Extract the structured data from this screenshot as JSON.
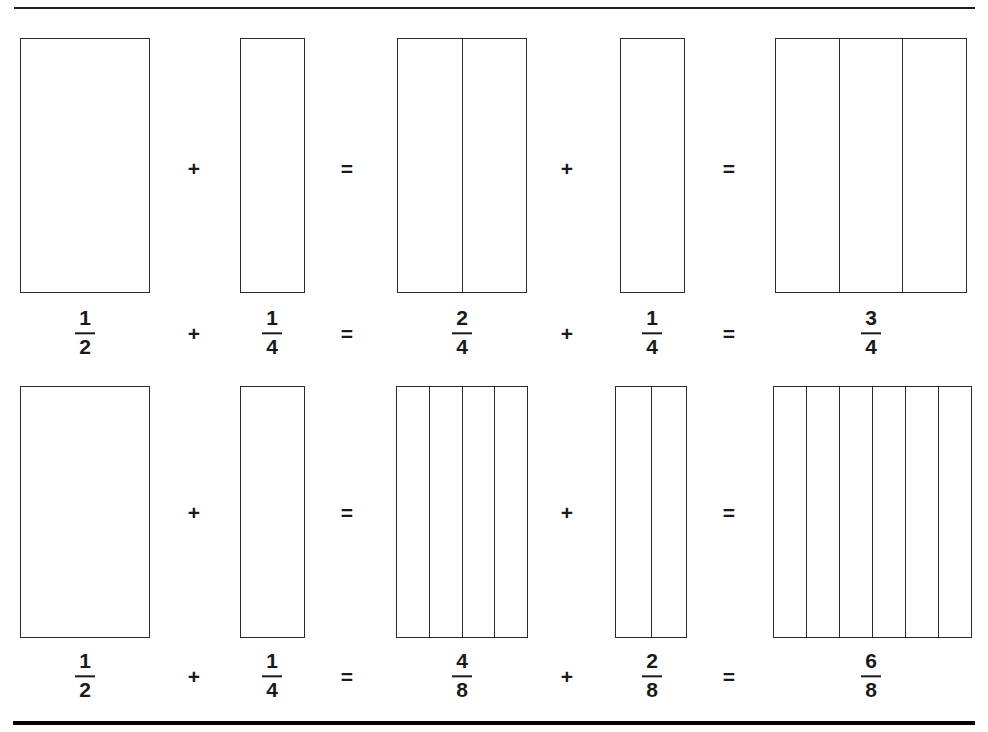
{
  "page": {
    "width": 988,
    "height": 732,
    "background": "#ffffff",
    "ink_color": "#2b2b2b",
    "text_color": "#1a1a1a"
  },
  "rules": {
    "top": {
      "name": "top-divider-rule",
      "x": 14,
      "y": 7,
      "width": 961,
      "height": 2
    },
    "bottom": {
      "name": "bottom-divider-rule",
      "x": 13,
      "y": 721,
      "width": 962,
      "height": 4
    }
  },
  "chart_data": {
    "type": "bar",
    "title": "",
    "subtitle": "",
    "xlabel": "",
    "ylabel": "",
    "rows": [
      {
        "id": "row-1",
        "equation": "1/2 + 1/4 = 2/4 + 1/4 = 3/4",
        "terms": [
          {
            "kind": "bar",
            "numerator": "1",
            "denominator": "2",
            "value": 0.5,
            "parts_total": 1,
            "parts_shaded": 1
          },
          {
            "kind": "operator",
            "symbol": "+"
          },
          {
            "kind": "bar",
            "numerator": "1",
            "denominator": "4",
            "value": 0.25,
            "parts_total": 1,
            "parts_shaded": 1
          },
          {
            "kind": "operator",
            "symbol": "="
          },
          {
            "kind": "bar",
            "numerator": "2",
            "denominator": "4",
            "value": 0.5,
            "parts_total": 2,
            "parts_shaded": 2
          },
          {
            "kind": "operator",
            "symbol": "+"
          },
          {
            "kind": "bar",
            "numerator": "1",
            "denominator": "4",
            "value": 0.25,
            "parts_total": 1,
            "parts_shaded": 1
          },
          {
            "kind": "operator",
            "symbol": "="
          },
          {
            "kind": "bar",
            "numerator": "3",
            "denominator": "4",
            "value": 0.75,
            "parts_total": 3,
            "parts_shaded": 3
          }
        ]
      },
      {
        "id": "row-2",
        "equation": "1/2 + 1/4 = 4/8 + 2/8 = 6/8",
        "terms": [
          {
            "kind": "bar",
            "numerator": "1",
            "denominator": "2",
            "value": 0.5,
            "parts_total": 1,
            "parts_shaded": 1
          },
          {
            "kind": "operator",
            "symbol": "+"
          },
          {
            "kind": "bar",
            "numerator": "1",
            "denominator": "4",
            "value": 0.25,
            "parts_total": 1,
            "parts_shaded": 1
          },
          {
            "kind": "operator",
            "symbol": "="
          },
          {
            "kind": "bar",
            "numerator": "4",
            "denominator": "8",
            "value": 0.5,
            "parts_total": 4,
            "parts_shaded": 4
          },
          {
            "kind": "operator",
            "symbol": "+"
          },
          {
            "kind": "bar",
            "numerator": "2",
            "denominator": "8",
            "value": 0.25,
            "parts_total": 2,
            "parts_shaded": 2
          },
          {
            "kind": "operator",
            "symbol": "="
          },
          {
            "kind": "bar",
            "numerator": "6",
            "denominator": "8",
            "value": 0.75,
            "parts_total": 6,
            "parts_shaded": 6
          }
        ]
      }
    ]
  },
  "row1": {
    "bars": {
      "b1": {
        "x": 20,
        "y": 38,
        "w": 130,
        "h": 255,
        "parts": 1
      },
      "b2": {
        "x": 240,
        "y": 38,
        "w": 65,
        "h": 255,
        "parts": 1
      },
      "b3": {
        "x": 397,
        "y": 38,
        "w": 130,
        "h": 255,
        "parts": 2
      },
      "b4": {
        "x": 620,
        "y": 38,
        "w": 65,
        "h": 255,
        "parts": 1
      },
      "b5": {
        "x": 775,
        "y": 38,
        "w": 192,
        "h": 255,
        "parts": 3
      }
    },
    "ops": {
      "plus1": {
        "symbol": "+",
        "x": 194,
        "y": 168
      },
      "equals1": {
        "symbol": "=",
        "x": 347,
        "y": 168
      },
      "plus2": {
        "symbol": "+",
        "x": 567,
        "y": 168
      },
      "equals2": {
        "symbol": "=",
        "x": 729,
        "y": 168
      }
    },
    "labels": {
      "f1": {
        "num": "1",
        "den": "2",
        "x": 85,
        "y": 333
      },
      "plus1": {
        "symbol": "+",
        "x": 194,
        "y": 333
      },
      "f2": {
        "num": "1",
        "den": "4",
        "x": 272,
        "y": 333
      },
      "equals1": {
        "symbol": "=",
        "x": 347,
        "y": 333
      },
      "f3": {
        "num": "2",
        "den": "4",
        "x": 462,
        "y": 333
      },
      "plus2": {
        "symbol": "+",
        "x": 567,
        "y": 333
      },
      "f4": {
        "num": "1",
        "den": "4",
        "x": 652,
        "y": 333
      },
      "equals2": {
        "symbol": "=",
        "x": 729,
        "y": 333
      },
      "f5": {
        "num": "3",
        "den": "4",
        "x": 871,
        "y": 333
      }
    }
  },
  "row2": {
    "bars": {
      "b1": {
        "x": 20,
        "y": 386,
        "w": 130,
        "h": 252,
        "parts": 1
      },
      "b2": {
        "x": 240,
        "y": 386,
        "w": 65,
        "h": 252,
        "parts": 1
      },
      "b3": {
        "x": 396,
        "y": 386,
        "w": 132,
        "h": 252,
        "parts": 4
      },
      "b4": {
        "x": 615,
        "y": 386,
        "w": 72,
        "h": 252,
        "parts": 2
      },
      "b5": {
        "x": 773,
        "y": 386,
        "w": 199,
        "h": 252,
        "parts": 6
      }
    },
    "ops": {
      "plus1": {
        "symbol": "+",
        "x": 194,
        "y": 512
      },
      "equals1": {
        "symbol": "=",
        "x": 347,
        "y": 512
      },
      "plus2": {
        "symbol": "+",
        "x": 567,
        "y": 512
      },
      "equals2": {
        "symbol": "=",
        "x": 729,
        "y": 512
      }
    },
    "labels": {
      "f1": {
        "num": "1",
        "den": "2",
        "x": 85,
        "y": 676
      },
      "plus1": {
        "symbol": "+",
        "x": 194,
        "y": 676
      },
      "f2": {
        "num": "1",
        "den": "4",
        "x": 272,
        "y": 676
      },
      "equals1": {
        "symbol": "=",
        "x": 347,
        "y": 676
      },
      "f3": {
        "num": "4",
        "den": "8",
        "x": 462,
        "y": 676
      },
      "plus2": {
        "symbol": "+",
        "x": 567,
        "y": 676
      },
      "f4": {
        "num": "2",
        "den": "8",
        "x": 652,
        "y": 676
      },
      "equals2": {
        "symbol": "=",
        "x": 729,
        "y": 676
      },
      "f5": {
        "num": "6",
        "den": "8",
        "x": 871,
        "y": 676
      }
    }
  }
}
